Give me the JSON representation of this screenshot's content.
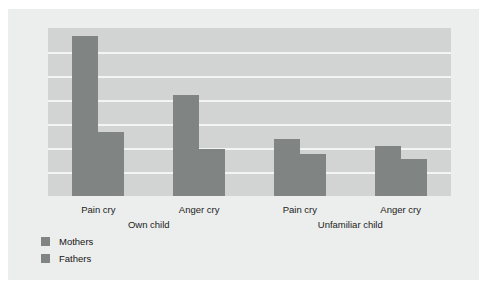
{
  "chart_data": {
    "type": "bar",
    "title": "",
    "subtitle": "",
    "xlabel": "",
    "ylabel": "",
    "categories": [
      "Pain cry",
      "Anger cry",
      "Pain cry",
      "Anger cry"
    ],
    "group_labels": [
      "Own child",
      "Unfamiliar child"
    ],
    "series": [
      {
        "name": "Mothers",
        "values": [
          95,
          60,
          34,
          30
        ],
        "color": "#808483"
      },
      {
        "name": "Fathers",
        "values": [
          38,
          28,
          25,
          22
        ],
        "color": "#808483"
      }
    ],
    "ylim": [
      0,
      100
    ],
    "grid": true,
    "gridline_count": 6,
    "legend_position": "bottom-left",
    "axis_tick_labels": [],
    "plot_background": "#d2d4d3",
    "figure_background": "#eceeed",
    "gridline_color": "#f3f4f4",
    "bar_color": "#808483"
  },
  "legend": {
    "items": [
      {
        "label": "Mothers"
      },
      {
        "label": "Fathers"
      }
    ]
  }
}
